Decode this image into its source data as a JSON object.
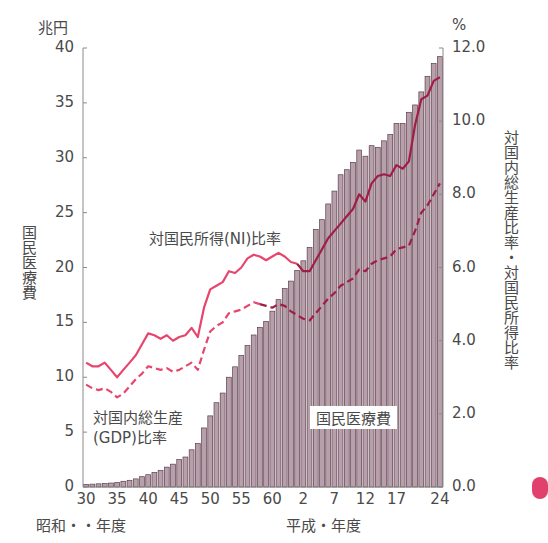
{
  "chart_data": {
    "type": "bar",
    "title": "",
    "left_axis": {
      "unit": "兆円",
      "label": "国民医療費",
      "ylim": [
        0,
        40
      ],
      "ticks": [
        0,
        5,
        10,
        15,
        20,
        25,
        30,
        35,
        40
      ]
    },
    "right_axis": {
      "unit": "%",
      "label": "対国内総生産比率・対国民所得比率",
      "ylim": [
        0.0,
        12.0
      ],
      "ticks": [
        "0.0",
        "2.0",
        "4.0",
        "6.0",
        "8.0",
        "10.0",
        "12.0"
      ]
    },
    "x_axis": {
      "era_labels": [
        "昭和・・年度",
        "平成・年度"
      ],
      "tick_labels": [
        "30",
        "35",
        "40",
        "45",
        "50",
        "55",
        "60",
        "2",
        "7",
        "12",
        "17",
        "24"
      ]
    },
    "categories": [
      "S30",
      "S31",
      "S32",
      "S33",
      "S34",
      "S35",
      "S36",
      "S37",
      "S38",
      "S39",
      "S40",
      "S41",
      "S42",
      "S43",
      "S44",
      "S45",
      "S46",
      "S47",
      "S48",
      "S49",
      "S50",
      "S51",
      "S52",
      "S53",
      "S54",
      "S55",
      "S56",
      "S57",
      "S58",
      "S59",
      "S60",
      "S61",
      "S62",
      "S63",
      "H1",
      "H2",
      "H3",
      "H4",
      "H5",
      "H6",
      "H7",
      "H8",
      "H9",
      "H10",
      "H11",
      "H12",
      "H13",
      "H14",
      "H15",
      "H16",
      "H17",
      "H18",
      "H19",
      "H20",
      "H21",
      "H22",
      "H23",
      "H24"
    ],
    "series": [
      {
        "name": "国民医療費",
        "type": "bar",
        "axis": "left",
        "color": "#b59aa6",
        "values": [
          0.24,
          0.26,
          0.29,
          0.32,
          0.36,
          0.41,
          0.52,
          0.61,
          0.74,
          0.94,
          1.12,
          1.32,
          1.52,
          1.81,
          2.08,
          2.5,
          2.73,
          3.39,
          3.96,
          5.38,
          6.48,
          7.68,
          8.56,
          10.0,
          10.95,
          11.98,
          12.88,
          13.85,
          14.54,
          15.09,
          16.02,
          17.07,
          18.08,
          18.76,
          19.73,
          20.61,
          21.83,
          23.47,
          24.36,
          25.79,
          26.96,
          28.45,
          28.91,
          29.58,
          30.7,
          30.14,
          31.1,
          30.95,
          31.54,
          32.11,
          33.13,
          33.12,
          34.14,
          34.81,
          36.0,
          37.42,
          38.59,
          39.21
        ]
      },
      {
        "name": "対国民所得(NI)比率",
        "type": "line",
        "style": "solid",
        "axis": "right",
        "values": [
          3.4,
          3.3,
          3.3,
          3.4,
          3.2,
          3.0,
          3.2,
          3.4,
          3.6,
          3.9,
          4.2,
          4.15,
          4.05,
          4.15,
          4.0,
          4.1,
          4.15,
          4.35,
          4.1,
          4.9,
          5.4,
          5.5,
          5.6,
          5.9,
          5.85,
          6.0,
          6.25,
          6.35,
          6.3,
          6.2,
          6.3,
          6.4,
          6.3,
          6.15,
          6.1,
          5.9,
          5.9,
          6.2,
          6.5,
          6.8,
          7.0,
          7.2,
          7.4,
          7.6,
          8.0,
          7.8,
          8.3,
          8.5,
          8.55,
          8.5,
          8.8,
          8.7,
          8.9,
          9.9,
          10.6,
          10.7,
          11.1,
          11.2
        ]
      },
      {
        "name": "対国内総生産(GDP)比率",
        "type": "line",
        "style": "dashed",
        "axis": "right",
        "values": [
          2.8,
          2.7,
          2.65,
          2.7,
          2.6,
          2.45,
          2.55,
          2.75,
          2.95,
          3.1,
          3.3,
          3.25,
          3.2,
          3.25,
          3.15,
          3.2,
          3.3,
          3.4,
          3.2,
          3.75,
          4.25,
          4.4,
          4.5,
          4.75,
          4.8,
          4.85,
          4.95,
          5.05,
          5.0,
          4.95,
          4.9,
          5.0,
          4.95,
          4.8,
          4.7,
          4.6,
          4.55,
          4.75,
          4.95,
          5.15,
          5.3,
          5.5,
          5.6,
          5.7,
          5.95,
          5.9,
          6.1,
          6.2,
          6.25,
          6.3,
          6.5,
          6.55,
          6.6,
          7.0,
          7.5,
          7.7,
          8.0,
          8.3
        ]
      }
    ],
    "annotations": [
      "対国民所得(NI)比率",
      "対国内総生産(GDP)比率",
      "国民医療費"
    ],
    "grid": false,
    "legend": "inline annotations"
  },
  "labels": {
    "left_unit": "兆円",
    "right_unit": "%",
    "left_axis_title": "国民医療費",
    "right_axis_title": "対国内総生産比率・対国民所得比率",
    "ni_annotation": "対国民所得(NI)比率",
    "gdp_annotation_line1": "対国内総生産",
    "gdp_annotation_line2": "(GDP)比率",
    "bar_annotation": "国民医療費",
    "era_showa": "昭和・・年度",
    "era_heisei": "平成・年度"
  },
  "left_ticks": [
    "40",
    "35",
    "30",
    "25",
    "20",
    "15",
    "10",
    "5",
    "0"
  ],
  "right_ticks": [
    "12.0",
    "10.0",
    "8.0",
    "6.0",
    "4.0",
    "2.0",
    "0.0"
  ],
  "x_ticks": [
    {
      "label": "30",
      "idx": 0
    },
    {
      "label": "35",
      "idx": 5
    },
    {
      "label": "40",
      "idx": 10
    },
    {
      "label": "45",
      "idx": 15
    },
    {
      "label": "50",
      "idx": 20
    },
    {
      "label": "55",
      "idx": 25
    },
    {
      "label": "60",
      "idx": 30
    },
    {
      "label": "2",
      "idx": 35
    },
    {
      "label": "7",
      "idx": 40
    },
    {
      "label": "12",
      "idx": 45
    },
    {
      "label": "17",
      "idx": 50
    },
    {
      "label": "24",
      "idx": 57
    }
  ],
  "colors": {
    "bar_fill": "#b8a0ab",
    "bar_stroke": "#5a3f4c",
    "ni_line": "#e8456e",
    "ni_line_dark": "#a01e45",
    "gdp_line": "#e8456e",
    "gdp_line_dark": "#a01e45",
    "axis": "#8a8a8a"
  }
}
